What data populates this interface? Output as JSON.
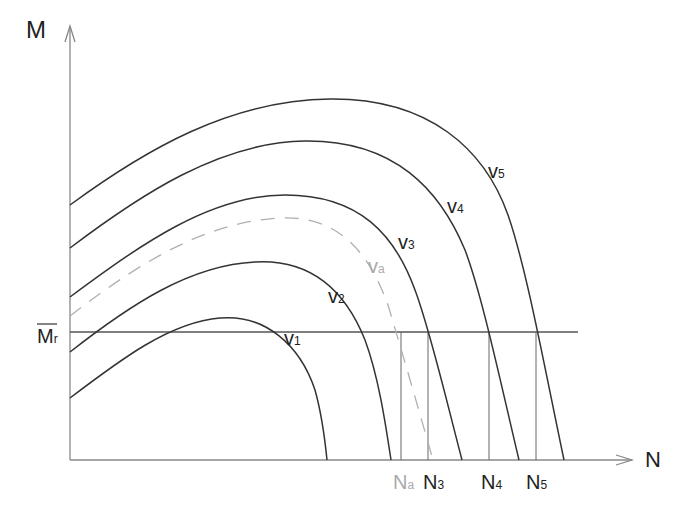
{
  "diagram": {
    "axes": {
      "y_label": "M",
      "x_label": "N",
      "ref_line_label": "M",
      "ref_line_sub": "r"
    },
    "curves": [
      {
        "id": "v1",
        "label": "v",
        "sub": "1",
        "style": "solid"
      },
      {
        "id": "v2",
        "label": "v",
        "sub": "2",
        "style": "solid"
      },
      {
        "id": "va",
        "label": "v",
        "sub": "a",
        "style": "dashed"
      },
      {
        "id": "v3",
        "label": "v",
        "sub": "3",
        "style": "solid"
      },
      {
        "id": "v4",
        "label": "v",
        "sub": "4",
        "style": "solid"
      },
      {
        "id": "v5",
        "label": "v",
        "sub": "5",
        "style": "solid"
      }
    ],
    "x_markers": [
      {
        "label": "N",
        "sub": "a"
      },
      {
        "label": "N",
        "sub": "3"
      },
      {
        "label": "N",
        "sub": "4"
      },
      {
        "label": "N",
        "sub": "5"
      }
    ],
    "colors": {
      "line": "#333333",
      "axis": "#888888",
      "dashed": "#b0b0b0"
    }
  }
}
